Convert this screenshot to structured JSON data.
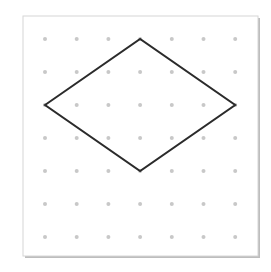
{
  "diagram": {
    "type": "dot-grid-shape",
    "shape": "rhombus",
    "grid": {
      "columns": 7,
      "rows": 7,
      "origin": [
        45,
        39
      ],
      "spacing": [
        31.7,
        33
      ],
      "dot_color": "#c8c8c8"
    },
    "frame": {
      "x": 23,
      "y": 16,
      "width": 235,
      "height": 240,
      "border_color": "#d0d0d0",
      "shadow_color": "#bdbdbd"
    },
    "polygon": {
      "vertices_grid": [
        [
          0,
          2
        ],
        [
          3,
          0
        ],
        [
          6,
          2
        ],
        [
          3,
          4
        ]
      ],
      "stroke_color": "#2b2b2b",
      "stroke_width": 2
    }
  }
}
